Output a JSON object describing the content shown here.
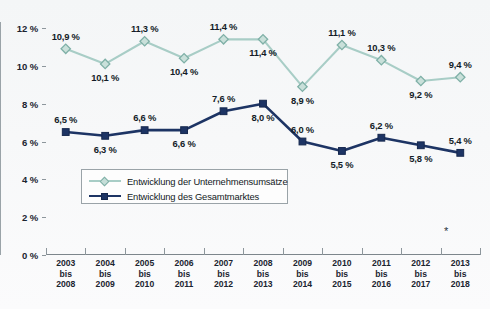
{
  "chart_data": {
    "type": "line",
    "title": "",
    "subtitle": "",
    "xlabel": "",
    "ylabel": "",
    "ylim": [
      0,
      12
    ],
    "ytick_values": [
      0,
      2,
      4,
      6,
      8,
      10,
      12
    ],
    "ytick_labels": [
      "0 %",
      "2 %",
      "4 %",
      "6 %",
      "8 %",
      "10 %",
      "12 %"
    ],
    "grid": false,
    "legend_position": "inside-left-lower",
    "categories": [
      "2003\nbis\n2008",
      "2004\nbis\n2009",
      "2005\nbis\n2010",
      "2006\nbis\n2011",
      "2007\nbis\n2012",
      "2008\nbis\n2013",
      "2009\nbis\n2014",
      "2010\nbis\n2015",
      "2011\nbis\n2016",
      "2012\nbis\n2017",
      "2013\nbis\n2018"
    ],
    "category_lines": [
      [
        "2003",
        "bis",
        "2008"
      ],
      [
        "2004",
        "bis",
        "2009"
      ],
      [
        "2005",
        "bis",
        "2010"
      ],
      [
        "2006",
        "bis",
        "2011"
      ],
      [
        "2007",
        "bis",
        "2012"
      ],
      [
        "2008",
        "bis",
        "2013"
      ],
      [
        "2009",
        "bis",
        "2014"
      ],
      [
        "2010",
        "bis",
        "2015"
      ],
      [
        "2011",
        "bis",
        "2016"
      ],
      [
        "2012",
        "bis",
        "2017"
      ],
      [
        "2013",
        "bis",
        "2018"
      ]
    ],
    "series": [
      {
        "name": "Entwicklung der Unternehmensumsätze",
        "color": "#a8cdc6",
        "marker": "diamond",
        "values": [
          10.9,
          10.1,
          11.3,
          10.4,
          11.4,
          11.4,
          8.9,
          11.1,
          10.3,
          9.2,
          9.4
        ],
        "labels": [
          "10,9 %",
          "10,1 %",
          "11,3 %",
          "10,4 %",
          "11,4 %",
          "11,4 %",
          "8,9 %",
          "11,1 %",
          "10,3 %",
          "9,2 %",
          "9,4 %"
        ],
        "label_positions": [
          "above",
          "below",
          "above",
          "below",
          "above",
          "below",
          "below",
          "above",
          "above",
          "below",
          "above"
        ]
      },
      {
        "name": "Entwicklung des Gesamtmarktes",
        "color": "#1d3464",
        "marker": "square",
        "values": [
          6.5,
          6.3,
          6.6,
          6.6,
          7.6,
          8.0,
          6.0,
          5.5,
          6.2,
          5.8,
          5.4
        ],
        "labels": [
          "6,5 %",
          "6,3 %",
          "6,6 %",
          "6,6 %",
          "7,6 %",
          "8,0 %",
          "6,0 %",
          "5,5 %",
          "6,2 %",
          "5,8 %",
          "5,4 %"
        ],
        "label_positions": [
          "above",
          "below",
          "above",
          "below",
          "above",
          "below",
          "above",
          "below",
          "above",
          "below",
          "above"
        ]
      }
    ]
  },
  "legend": {
    "items": [
      {
        "label": "Entwicklung der Unternehmensumsätze",
        "color": "#a8cdc6",
        "marker": "diamond"
      },
      {
        "label": "Entwicklung des Gesamtmarktes",
        "color": "#1d3464",
        "marker": "square"
      }
    ]
  },
  "annotations": {
    "footnote_marker": "*"
  },
  "colors": {
    "series_light": "#a8cdc6",
    "series_dark": "#1d3464",
    "axis": "#8d969c",
    "text": "#131c27",
    "background": "#f6f7f8"
  }
}
